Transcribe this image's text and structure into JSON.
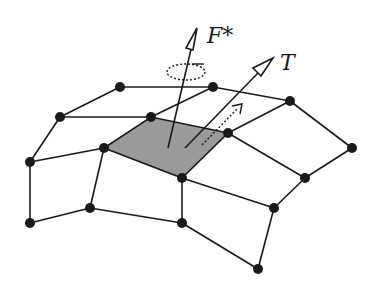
{
  "diagram": {
    "labels": {
      "force": "F*",
      "torque": "T"
    },
    "colors": {
      "line": "#1a1a1a",
      "shaded_face": "#9a9a9a",
      "background": "#ffffff"
    },
    "nodes": [
      {
        "id": "A",
        "x": 120,
        "y": 87
      },
      {
        "id": "B",
        "x": 213,
        "y": 87
      },
      {
        "id": "C",
        "x": 290,
        "y": 101
      },
      {
        "id": "D",
        "x": 60,
        "y": 117
      },
      {
        "id": "E",
        "x": 151,
        "y": 117
      },
      {
        "id": "F",
        "x": 104,
        "y": 148
      },
      {
        "id": "G",
        "x": 228,
        "y": 133
      },
      {
        "id": "H",
        "x": 352,
        "y": 148
      },
      {
        "id": "I",
        "x": 30,
        "y": 162
      },
      {
        "id": "J",
        "x": 182,
        "y": 178
      },
      {
        "id": "K",
        "x": 305,
        "y": 178
      },
      {
        "id": "L",
        "x": 30,
        "y": 223
      },
      {
        "id": "M",
        "x": 90,
        "y": 208
      },
      {
        "id": "N",
        "x": 182,
        "y": 223
      },
      {
        "id": "O",
        "x": 274,
        "y": 208
      },
      {
        "id": "P",
        "x": 258,
        "y": 269
      }
    ],
    "shaded_face": [
      "F",
      "E",
      "G",
      "J"
    ]
  }
}
